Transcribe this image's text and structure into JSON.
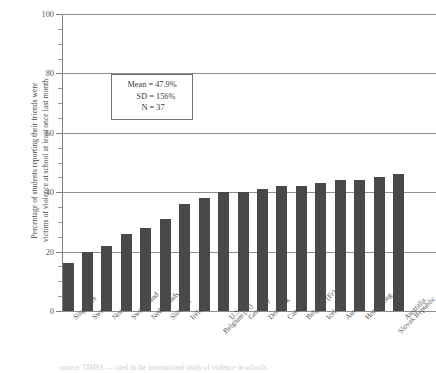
{
  "chart_data": {
    "type": "bar",
    "title": "",
    "xlabel": "",
    "ylabel_line1": "Percentage of students reporting their friends were",
    "ylabel_line2": "victims of violence at school at least once last month",
    "ylim": [
      0,
      100
    ],
    "ytick_labels": [
      "0",
      "20",
      "40",
      "60",
      "80",
      "100"
    ],
    "ytick_values": [
      0,
      20,
      40,
      60,
      80,
      100
    ],
    "minor_tick_step": 5,
    "grid": true,
    "legend": "none",
    "bar_color": "#494949",
    "categories": [
      "Singapore",
      "Sweden",
      "Norway",
      "Switzerland",
      "Netherlands",
      "Slovenia",
      "Ireland",
      "Belgium (Fl)",
      "U.S.A.",
      "Germany",
      "Denmark",
      "Canada",
      "Belgium (Fr)",
      "Iceland",
      "Austria",
      "Hong Kong",
      "Slovak Republic",
      "Australia"
    ],
    "values": [
      16,
      20,
      22,
      26,
      28,
      31,
      36,
      38,
      40,
      40,
      41,
      42,
      42,
      43,
      44,
      44,
      45,
      46
    ],
    "annotation": {
      "mean_label": "Mean = 47.9%",
      "sd_label": "SD = 156%",
      "n_label": "N = 37"
    }
  },
  "caption": {
    "text": "source: TIMSS — cited in the international study of violence in schools"
  }
}
